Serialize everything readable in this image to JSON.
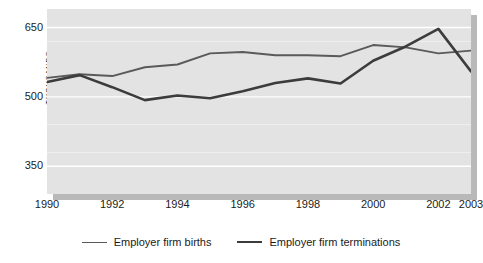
{
  "chart_data": {
    "type": "line",
    "title": "",
    "xlabel": "",
    "ylabel": "THOUSANDS",
    "x": [
      1990,
      1991,
      1992,
      1993,
      1994,
      1995,
      1996,
      1997,
      1998,
      1999,
      2000,
      2001,
      2002,
      2003
    ],
    "xticks": [
      "1990",
      "1992",
      "1994",
      "1996",
      "1998",
      "2000",
      "2002",
      "2003"
    ],
    "xtick_values": [
      1990,
      1992,
      1994,
      1996,
      1998,
      2000,
      2002,
      2003
    ],
    "yticks": [
      "650",
      "500",
      "350"
    ],
    "ytick_values": [
      650,
      500,
      350
    ],
    "ylim": [
      290,
      690
    ],
    "xlim": [
      1990,
      2003
    ],
    "grid": true,
    "grid_color": "#ffffff",
    "plot_background": "#e3e3e3",
    "legend_position": "bottom",
    "series": [
      {
        "name": "Employer firm births",
        "color": "#5a5a5a",
        "width": 1.9,
        "values": [
          541,
          549,
          545,
          564,
          570,
          594,
          597,
          590,
          590,
          588,
          612,
          607,
          594,
          600
        ]
      },
      {
        "name": "Employer firm terminations",
        "color": "#3c3c3c",
        "width": 2.6,
        "values": [
          532,
          547,
          521,
          493,
          503,
          497,
          512,
          530,
          540,
          529,
          578,
          609,
          647,
          555
        ]
      }
    ]
  },
  "legend": {
    "items": [
      {
        "label": "Employer firm births"
      },
      {
        "label": "Employer firm terminations"
      }
    ]
  },
  "colors": {
    "plot_fill": "#e3e3e3",
    "shadow": "#b9b9b9",
    "gridline": "#ffffff",
    "text": "#1b1b1b",
    "series_births": "#5a5a5a",
    "series_terminations": "#3c3c3c"
  }
}
